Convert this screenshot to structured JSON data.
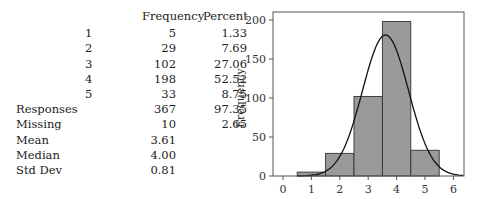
{
  "table": {
    "headers": {
      "frequency": "Frequency",
      "percent": "Percent"
    },
    "rows": [
      {
        "label": "1",
        "frequency": "5",
        "percent": "1.33"
      },
      {
        "label": "2",
        "frequency": "29",
        "percent": "7.69"
      },
      {
        "label": "3",
        "frequency": "102",
        "percent": "27.06"
      },
      {
        "label": "4",
        "frequency": "198",
        "percent": "52.52"
      },
      {
        "label": "5",
        "frequency": "33",
        "percent": "8.75"
      }
    ],
    "summary": [
      {
        "label": "Responses",
        "frequency": "367",
        "percent": "97.35"
      },
      {
        "label": "Missing",
        "frequency": "10",
        "percent": "2.65"
      },
      {
        "label": "Mean",
        "frequency": "3.61",
        "percent": ""
      },
      {
        "label": "Median",
        "frequency": "4.00",
        "percent": ""
      },
      {
        "label": "Std Dev",
        "frequency": "0.81",
        "percent": ""
      }
    ]
  },
  "chart_data": {
    "type": "bar",
    "title": "",
    "xlabel": "",
    "ylabel": "Frequency",
    "categories": [
      "1",
      "2",
      "3",
      "4",
      "5"
    ],
    "values": [
      5,
      29,
      102,
      198,
      33
    ],
    "x_ticks": [
      "0",
      "1",
      "2",
      "3",
      "4",
      "5",
      "6"
    ],
    "y_ticks": [
      "0",
      "50",
      "100",
      "150",
      "200"
    ],
    "xlim": [
      -0.4,
      6.4
    ],
    "ylim": [
      0,
      210
    ],
    "grid": false,
    "overlay": {
      "type": "normal_curve",
      "mean": 3.61,
      "std_dev": 0.81,
      "n": 367
    },
    "colors": {
      "bar_fill": "#9a9a9a",
      "bar_edge": "#333333",
      "curve": "#111111"
    }
  }
}
